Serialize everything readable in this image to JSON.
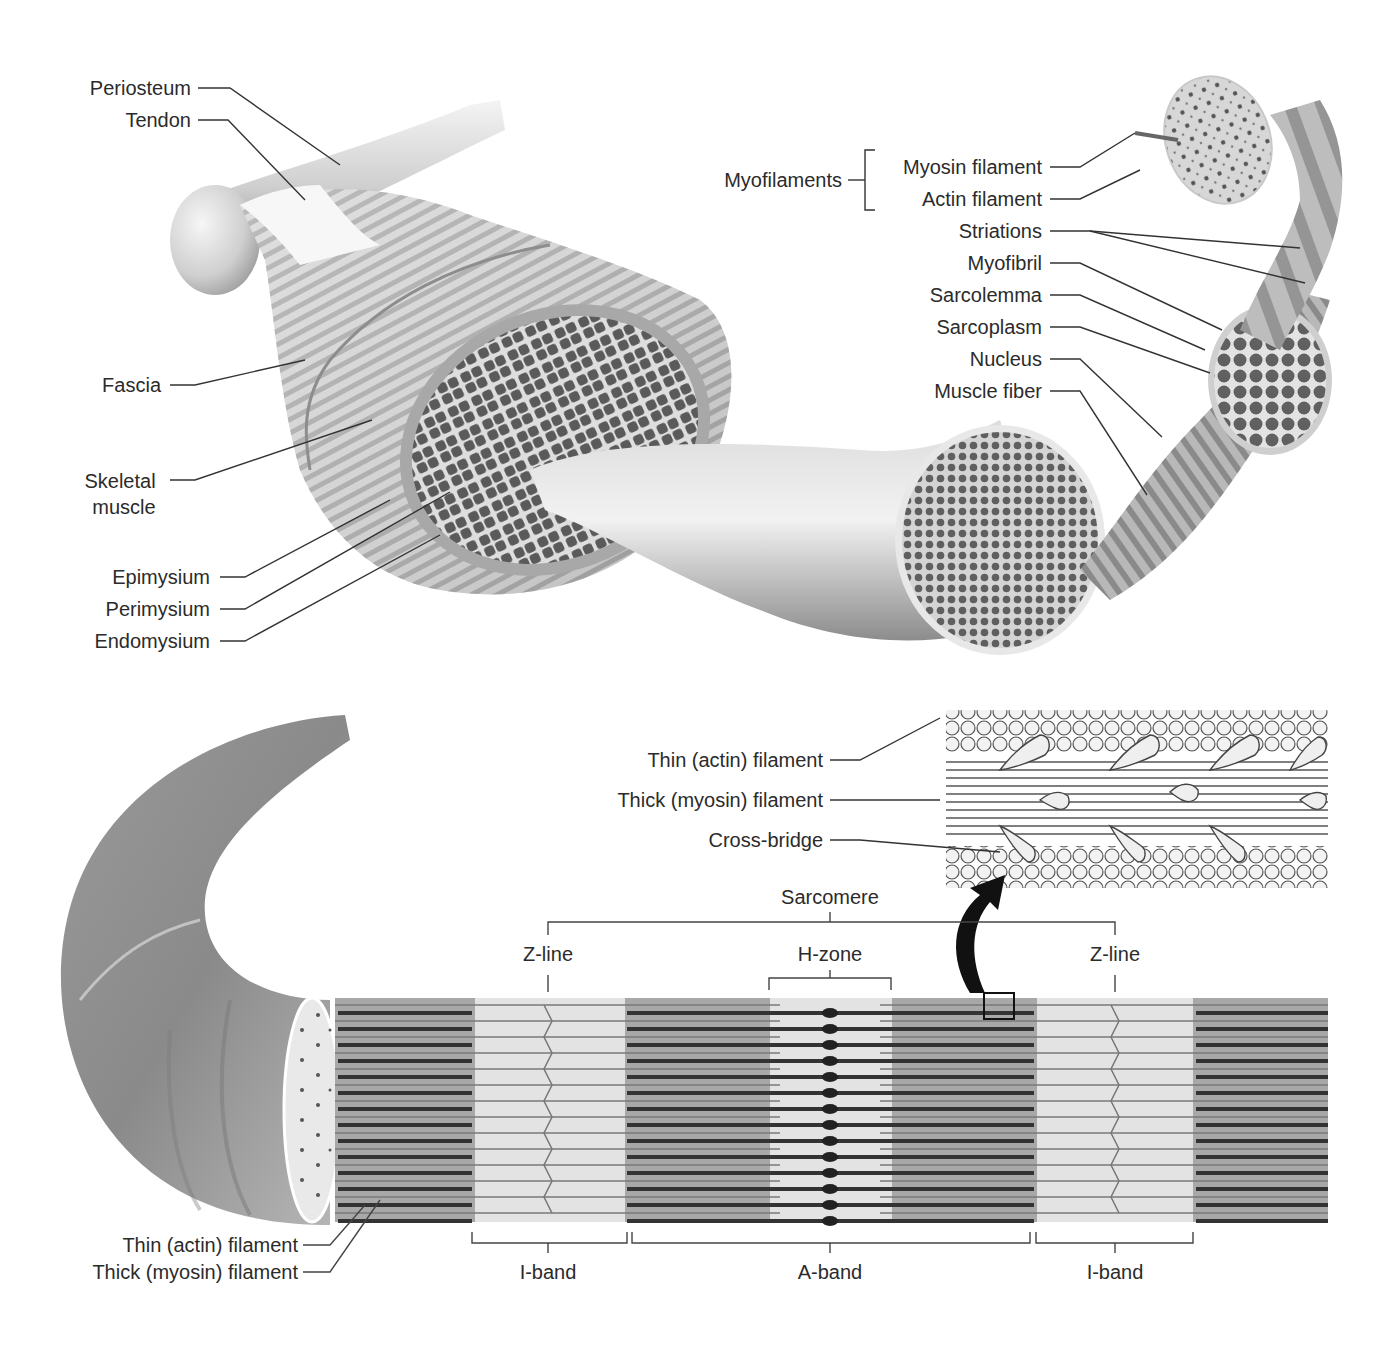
{
  "figure": {
    "top_panel": {
      "left_labels": [
        {
          "id": "periosteum",
          "text": "Periosteum"
        },
        {
          "id": "tendon",
          "text": "Tendon"
        },
        {
          "id": "fascia",
          "text": "Fascia"
        },
        {
          "id": "skeletal_muscle_1",
          "text": "Skeletal"
        },
        {
          "id": "skeletal_muscle_2",
          "text": "muscle"
        },
        {
          "id": "epimysium",
          "text": "Epimysium"
        },
        {
          "id": "perimysium",
          "text": "Perimysium"
        },
        {
          "id": "endomysium",
          "text": "Endomysium"
        }
      ],
      "group_label": "Myofilaments",
      "right_labels": [
        {
          "id": "myosin_filament",
          "text": "Myosin filament"
        },
        {
          "id": "actin_filament",
          "text": "Actin filament"
        },
        {
          "id": "striations",
          "text": "Striations"
        },
        {
          "id": "myofibril",
          "text": "Myofibril"
        },
        {
          "id": "sarcolemma",
          "text": "Sarcolemma"
        },
        {
          "id": "sarcoplasm",
          "text": "Sarcoplasm"
        },
        {
          "id": "nucleus",
          "text": "Nucleus"
        },
        {
          "id": "muscle_fiber",
          "text": "Muscle fiber"
        }
      ]
    },
    "inset": {
      "labels": [
        {
          "id": "thin_actin",
          "text": "Thin (actin) filament"
        },
        {
          "id": "thick_myosin",
          "text": "Thick (myosin) filament"
        },
        {
          "id": "cross_bridge",
          "text": "Cross-bridge"
        }
      ]
    },
    "sarcomere_panel": {
      "sarcomere": "Sarcomere",
      "z_line_left": "Z-line",
      "h_zone": "H-zone",
      "z_line_right": "Z-line",
      "bottom_bands": [
        {
          "id": "i_band_left",
          "text": "I-band"
        },
        {
          "id": "a_band",
          "text": "A-band"
        },
        {
          "id": "i_band_right",
          "text": "I-band"
        }
      ],
      "bottom_left_labels": [
        {
          "id": "thin_actin_bottom",
          "text": "Thin (actin) filament"
        },
        {
          "id": "thick_myosin_bottom",
          "text": "Thick (myosin) filament"
        }
      ]
    },
    "colors": {
      "background": "#ffffff",
      "text": "#2b2b2b",
      "leader_line": "#333333",
      "muscle_light": "#d8d8d8",
      "muscle_mid": "#a9a9a9",
      "muscle_dark": "#6d6d6d",
      "fascicle_fill": "#5e5e5e",
      "i_band": "#e4e4e4",
      "a_band": "#a6a6a6",
      "arrow": "#111111"
    }
  }
}
